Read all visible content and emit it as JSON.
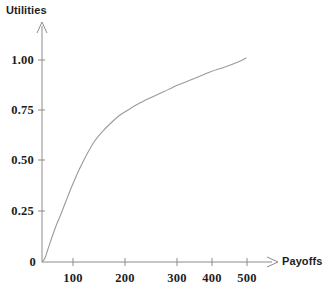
{
  "chart_data": {
    "type": "line",
    "title": "",
    "subtitle": "",
    "xlabel": "Payoffs",
    "ylabel": "Utilities",
    "grid": false,
    "legend": "none",
    "xlim": [
      0,
      520
    ],
    "ylim": [
      0,
      1.06
    ],
    "x_ticks": [
      100,
      200,
      300,
      400,
      500
    ],
    "x_tick_labels": [
      "100",
      "200",
      "300",
      "400",
      "500"
    ],
    "x_tick_px": [
      73,
      125,
      177,
      212,
      247
    ],
    "y_ticks": [
      0,
      0.25,
      0.5,
      0.75,
      1.0
    ],
    "y_tick_labels": [
      "0",
      "0.25",
      "0.50",
      "0.75",
      "1.00"
    ],
    "y_tick_px": [
      262,
      211,
      160,
      110,
      60
    ],
    "origin_label": "0",
    "series": [
      {
        "name": "utility-curve",
        "color": "#9a9a9a",
        "x": [
          0,
          10,
          25,
          40,
          60,
          80,
          100,
          120,
          140,
          150,
          160,
          170,
          180,
          200,
          225,
          250,
          275,
          300,
          330,
          360,
          400,
          440,
          470,
          500
        ],
        "values": [
          0.0,
          0.09,
          0.18,
          0.25,
          0.33,
          0.41,
          0.48,
          0.55,
          0.63,
          0.665,
          0.695,
          0.715,
          0.73,
          0.755,
          0.785,
          0.81,
          0.83,
          0.85,
          0.875,
          0.9,
          0.93,
          0.96,
          0.98,
          1.0
        ],
        "points_px": [
          [
            42,
            262
          ],
          [
            45,
            258
          ],
          [
            48,
            249
          ],
          [
            52,
            237
          ],
          [
            56,
            226
          ],
          [
            61,
            214
          ],
          [
            66,
            201
          ],
          [
            72,
            186
          ],
          [
            79,
            170
          ],
          [
            86,
            156
          ],
          [
            94,
            142
          ],
          [
            103,
            131
          ],
          [
            112,
            122
          ],
          [
            120,
            115
          ],
          [
            128,
            110
          ],
          [
            138,
            104
          ],
          [
            150,
            98
          ],
          [
            163,
            92
          ],
          [
            178,
            85
          ],
          [
            193,
            79
          ],
          [
            210,
            72
          ],
          [
            225,
            67
          ],
          [
            238,
            62
          ],
          [
            246,
            58
          ]
        ]
      }
    ],
    "annotations": [],
    "axis_arrows": true
  },
  "axes": {
    "y_axis_title": "Utilities",
    "x_axis_title": "Payoffs"
  },
  "style": {
    "curve_color": "#9a9a9a",
    "axis_color": "#8c8c8c",
    "text_color": "#1d1d1d",
    "background": "#ffffff"
  }
}
